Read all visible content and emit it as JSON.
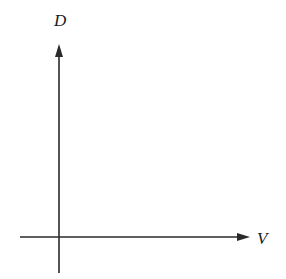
{
  "diagram": {
    "type": "coordinate-axes",
    "y_axis": {
      "label": "D",
      "direction": "up"
    },
    "x_axis": {
      "label": "V",
      "direction": "right"
    },
    "line_color": "#2a2a2a",
    "label_color": "#1a1a1a"
  }
}
